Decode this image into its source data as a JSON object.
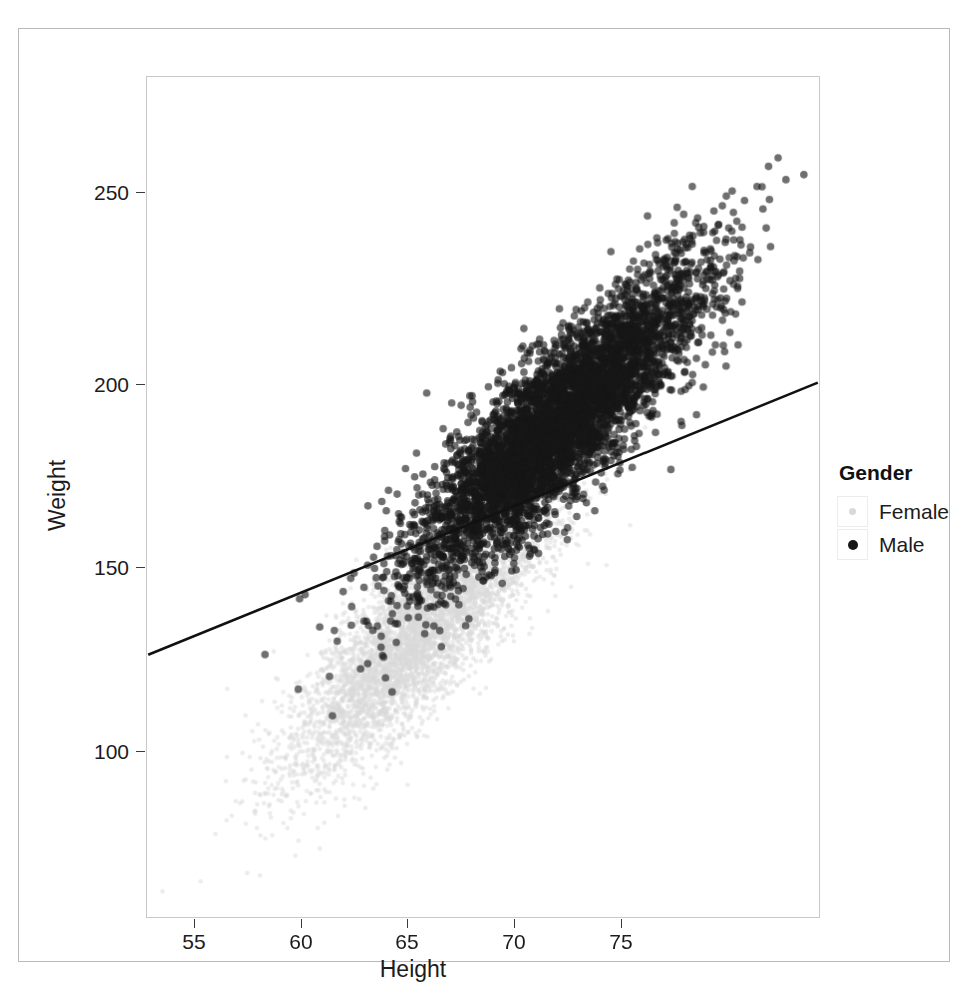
{
  "chart_data": {
    "type": "scatter",
    "title": "",
    "xlabel": "Height",
    "ylabel": "Weight",
    "xlim": [
      52.5,
      79.5
    ],
    "ylim": [
      62,
      275
    ],
    "xticks": [
      55,
      60,
      65,
      70,
      75
    ],
    "yticks": [
      100,
      150,
      200,
      250
    ],
    "xtick_labels": [
      "55",
      "60",
      "65",
      "70",
      "75"
    ],
    "ytick_labels": [
      "100",
      "150",
      "200",
      "250"
    ],
    "grid": false,
    "legend": {
      "title": "Gender",
      "position": "right",
      "entries": [
        {
          "label": "Female",
          "color": "#d9d9d9",
          "marker": "circle",
          "size": "small"
        },
        {
          "label": "Male",
          "color": "#161616",
          "marker": "circle",
          "size": "large"
        }
      ]
    },
    "series": [
      {
        "name": "Female",
        "color": "#d9d9d9",
        "n_points": 5000,
        "mean_x": 63.7,
        "sd_x": 2.7,
        "mean_y": 135.9,
        "sd_y": 19.0,
        "correlation": 0.85
      },
      {
        "name": "Male",
        "color": "#161616",
        "n_points": 5000,
        "mean_x": 69.0,
        "sd_x": 2.9,
        "mean_y": 187.0,
        "sd_y": 19.4,
        "correlation": 0.86
      }
    ],
    "annotations": [
      {
        "type": "line",
        "name": "regression-line",
        "color": "#111111",
        "x_start": 52.55,
        "y_start": 128.5,
        "x_end": 79.45,
        "y_end": 197.5
      }
    ]
  },
  "axes": {
    "y": {
      "title": "Weight",
      "ticks": [
        {
          "label": "250",
          "value": 250
        },
        {
          "label": "200",
          "value": 200
        },
        {
          "label": "150",
          "value": 150
        },
        {
          "label": "100",
          "value": 100
        }
      ]
    },
    "x": {
      "title": "Height",
      "ticks": [
        {
          "label": "55",
          "value": 55
        },
        {
          "label": "60",
          "value": 60
        },
        {
          "label": "65",
          "value": 65
        },
        {
          "label": "70",
          "value": 70
        },
        {
          "label": "75",
          "value": 75
        }
      ]
    }
  },
  "legend": {
    "title": "Gender",
    "items": [
      {
        "label": "Female"
      },
      {
        "label": "Male"
      }
    ]
  },
  "colors": {
    "female": "#d9d9d9",
    "male": "#161616",
    "line": "#111111",
    "frame": "#c9c9c9",
    "page_border": "#b9b9b9",
    "text": "#1c1c1c"
  }
}
